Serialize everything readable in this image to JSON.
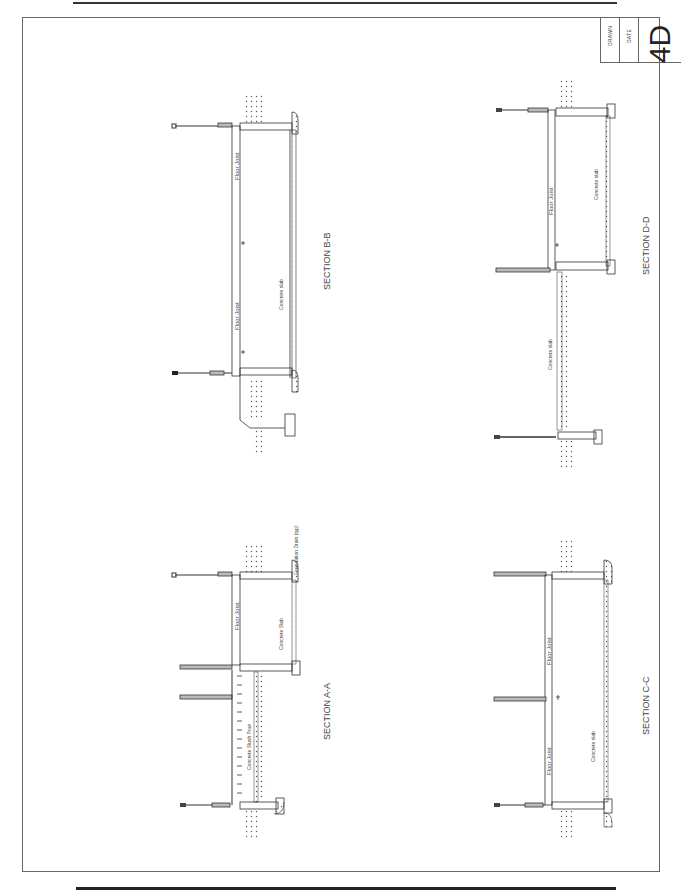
{
  "title_block": {
    "drawn_label": "DRAWN",
    "date_label": "DATE",
    "sheet_number": "4D"
  },
  "sections": [
    {
      "id": "B-B",
      "title": "SECTION B-B",
      "labels": [
        "Floor Joist",
        "Floor Joist",
        "Concrete slab"
      ]
    },
    {
      "id": "D-D",
      "title": "SECTION D-D",
      "labels": [
        "Floor Joist",
        "Concrete slab",
        "Concrete slab"
      ]
    },
    {
      "id": "A-A",
      "title": "SECTION A-A",
      "labels": [
        "Floor Joist",
        "Concrete Slab",
        "Foundation Drain (typ)",
        "Concrete Slush Pour"
      ]
    },
    {
      "id": "C-C",
      "title": "SECTION C-C",
      "labels": [
        "Floor Joist",
        "Floor Joist",
        "Concrete slab"
      ]
    }
  ],
  "colors": {
    "line": "#333333",
    "frame": "#666666",
    "text": "#444444"
  }
}
